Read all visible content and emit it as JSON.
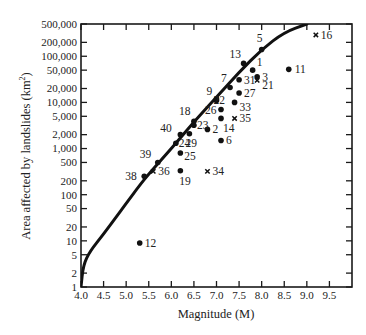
{
  "chart_data": {
    "type": "scatter",
    "title": "",
    "xlabel": "Magnitude (M)",
    "ylabel": "Area affected by landslides (km²)",
    "xlim": [
      4.0,
      10.0
    ],
    "ylim": [
      1,
      500000
    ],
    "yscale": "log",
    "grid": false,
    "legend": null,
    "x_ticks": [
      4.0,
      4.5,
      5.0,
      5.5,
      6.0,
      6.5,
      7.0,
      7.5,
      8.0,
      8.5,
      9.0,
      9.5
    ],
    "x_tick_labels": [
      "4.0",
      "4.5",
      "5.0",
      "5.5",
      "6.0",
      "6.5",
      "7.0",
      "7.5",
      "8.0",
      "8.5",
      "9.0",
      "9.5"
    ],
    "y_ticks": [
      1,
      2,
      5,
      10,
      20,
      50,
      100,
      200,
      500,
      1000,
      2000,
      5000,
      10000,
      20000,
      50000,
      100000,
      200000,
      500000
    ],
    "y_tick_labels": [
      "1",
      "2",
      "5",
      "10",
      "20",
      "50",
      "100",
      "200",
      "500",
      "1,000",
      "2,000",
      "5,000",
      "10,000",
      "20,000",
      "50,000",
      "100,000",
      "200,000",
      "500,000"
    ],
    "upper_bound_curve": {
      "name": "Upper bound",
      "points": [
        [
          4.0,
          1
        ],
        [
          4.05,
          3
        ],
        [
          4.2,
          6
        ],
        [
          4.5,
          14
        ],
        [
          4.8,
          35
        ],
        [
          5.0,
          65
        ],
        [
          5.3,
          160
        ],
        [
          5.5,
          280
        ],
        [
          6.0,
          1000
        ],
        [
          6.5,
          3800
        ],
        [
          7.0,
          13000
        ],
        [
          7.5,
          45000
        ],
        [
          8.0,
          140000
        ],
        [
          8.5,
          330000
        ],
        [
          9.0,
          500000
        ]
      ]
    },
    "series": [
      {
        "name": "Events (dot)",
        "marker": "dot",
        "points": [
          {
            "id": "1",
            "M": 7.8,
            "A": 50000
          },
          {
            "id": "2",
            "M": 6.8,
            "A": 2600
          },
          {
            "id": "3",
            "M": 7.9,
            "A": 36000
          },
          {
            "id": "5",
            "M": 8.0,
            "A": 140000
          },
          {
            "id": "6",
            "M": 7.1,
            "A": 1500
          },
          {
            "id": "7",
            "M": 7.3,
            "A": 21000
          },
          {
            "id": "9",
            "M": 7.0,
            "A": 12000
          },
          {
            "id": "11",
            "M": 8.6,
            "A": 52000
          },
          {
            "id": "12",
            "M": 5.3,
            "A": 9
          },
          {
            "id": "13",
            "M": 7.6,
            "A": 70000
          },
          {
            "id": "14",
            "M": 7.1,
            "A": 4500
          },
          {
            "id": "18",
            "M": 6.5,
            "A": 3900
          },
          {
            "id": "19",
            "M": 6.2,
            "A": 330
          },
          {
            "id": "22",
            "M": 7.0,
            "A": 11000
          },
          {
            "id": "23",
            "M": 6.5,
            "A": 3200
          },
          {
            "id": "24",
            "M": 6.1,
            "A": 1300
          },
          {
            "id": "25",
            "M": 6.2,
            "A": 800
          },
          {
            "id": "26",
            "M": 7.1,
            "A": 7000
          },
          {
            "id": "27",
            "M": 7.5,
            "A": 16000
          },
          {
            "id": "29",
            "M": 6.4,
            "A": 2100
          },
          {
            "id": "31",
            "M": 7.5,
            "A": 31000
          },
          {
            "id": "33",
            "M": 7.4,
            "A": 10000
          },
          {
            "id": "38",
            "M": 5.4,
            "A": 250
          },
          {
            "id": "39",
            "M": 5.7,
            "A": 500
          },
          {
            "id": "40",
            "M": 6.2,
            "A": 2000
          }
        ]
      },
      {
        "name": "Events (x)",
        "marker": "x",
        "points": [
          {
            "id": "16",
            "M": 9.2,
            "A": 290000
          },
          {
            "id": "21",
            "M": 7.9,
            "A": 30000
          },
          {
            "id": "34",
            "M": 6.8,
            "A": 320
          },
          {
            "id": "35",
            "M": 7.4,
            "A": 4500
          },
          {
            "id": "36",
            "M": 5.6,
            "A": 320
          }
        ]
      }
    ]
  },
  "labels": {
    "xlabel": "Magnitude (M)",
    "ylabel_main": "Area affected by landslides (km",
    "ylabel_sup": "2",
    "ylabel_close": ")"
  }
}
